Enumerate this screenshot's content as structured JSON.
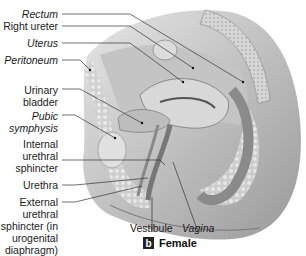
{
  "figure": {
    "panel_letter": "b",
    "caption": "Female",
    "labels": {
      "rectum": "Rectum",
      "right_ureter": "Right ureter",
      "uterus": "Uterus",
      "peritoneum": "Peritoneum",
      "urinary_bladder": "Urinary\nbladder",
      "pubic_symphysis": "Pubic\nsymphysis",
      "internal_urethral_sphincter": "Internal\nurethral\nsphincter",
      "urethra": "Urethra",
      "external_urethral_sphincter": "External\nurethral\nsphincter (in\nurogenital\ndiaphragm)",
      "vestibule": "Vestibule",
      "vagina": "Vagina"
    },
    "colors": {
      "illustration_gray": "#b8b8b8",
      "text": "#1a1a1a",
      "leader_line": "#333333"
    }
  }
}
